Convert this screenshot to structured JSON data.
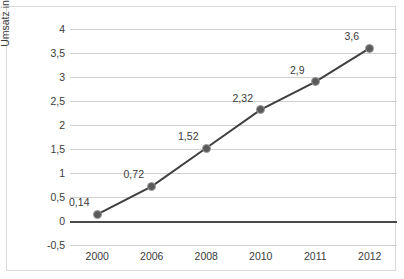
{
  "chart_data": {
    "type": "line",
    "title": "",
    "xlabel": "",
    "ylabel": "Umsatz in Milliarden Euro",
    "categories": [
      "2000",
      "2006",
      "2008",
      "2010",
      "2011",
      "2012"
    ],
    "values": [
      0.14,
      0.72,
      1.52,
      2.32,
      2.9,
      3.6
    ],
    "point_labels": [
      "0,14",
      "0,72",
      "1,52",
      "2,32",
      "2,9",
      "3,6"
    ],
    "ylim": [
      -0.5,
      4
    ],
    "ytick_values": [
      4,
      3.5,
      3,
      2.5,
      2,
      1.5,
      1,
      0.5,
      0,
      -0.5
    ],
    "ytick_labels": [
      "4",
      "3,5",
      "3",
      "2,5",
      "2",
      "1,5",
      "1",
      "0,5",
      "0",
      "-0,5"
    ],
    "grid": true,
    "legend": false,
    "series_color": "#3f3f3f",
    "marker_fill_color": "#5a5a5a",
    "marker_edge_color": "#9a9a9a",
    "gridline_color": "#d0d0d0",
    "zero_line_color": "#4a4a4a",
    "text_color": "#3b3b3b",
    "border_color": "#d9d9d9",
    "background_color": "#ffffff"
  }
}
